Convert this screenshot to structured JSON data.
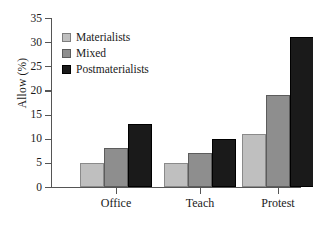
{
  "chart_data": {
    "type": "bar",
    "title": "",
    "subtitle": "",
    "xlabel": "",
    "ylabel": "Allow (%)",
    "categories": [
      "Office",
      "Teach",
      "Protest"
    ],
    "series": [
      {
        "name": "Materialists",
        "color": "#bfbfbf",
        "values": [
          5,
          5,
          11
        ]
      },
      {
        "name": "Mixed",
        "color": "#8e8e8e",
        "values": [
          8,
          7,
          19
        ]
      },
      {
        "name": "Postmaterialists",
        "color": "#1a1a1a",
        "values": [
          13,
          10,
          31
        ]
      }
    ],
    "ylim": [
      0,
      35
    ],
    "yticks": [
      0,
      5,
      10,
      15,
      20,
      25,
      30,
      35
    ],
    "ytick_labels": [
      "0",
      "5",
      "10",
      "15",
      "20",
      "25",
      "30",
      "35"
    ],
    "grid": false,
    "legend_position": "upper-left"
  }
}
